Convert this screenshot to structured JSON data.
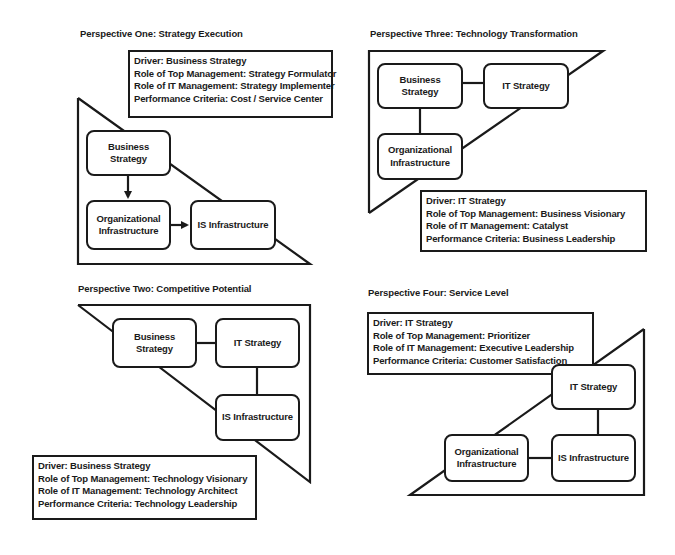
{
  "perspectives": [
    {
      "id": "one",
      "title": "Perspective One: Strategy Execution",
      "info": {
        "driver": "Driver: Business Strategy",
        "top_mgmt": "Role of Top Management: Strategy Formulator",
        "it_mgmt": "Role of IT Management: Strategy Implementer",
        "criteria": "Performance Criteria: Cost / Service Center"
      },
      "nodes": {
        "business_strategy": [
          "Business",
          "Strategy"
        ],
        "org_infra": [
          "Organizational",
          "Infrastructure"
        ],
        "is_infra": [
          "IS Infrastructure"
        ]
      }
    },
    {
      "id": "three",
      "title": "Perspective Three: Technology Transformation",
      "info": {
        "driver": "Driver: IT Strategy",
        "top_mgmt": "Role of Top Management: Business Visionary",
        "it_mgmt": "Role of IT Management: Catalyst",
        "criteria": "Performance Criteria: Business Leadership"
      },
      "nodes": {
        "business_strategy": [
          "Business",
          "Strategy"
        ],
        "it_strategy": [
          "IT Strategy"
        ],
        "org_infra": [
          "Organizational",
          "Infrastructure"
        ]
      }
    },
    {
      "id": "two",
      "title": "Perspective Two: Competitive Potential",
      "info": {
        "driver": "Driver: Business Strategy",
        "top_mgmt": "Role of Top Management: Technology Visionary",
        "it_mgmt": "Role of IT Management: Technology Architect",
        "criteria": "Performance Criteria: Technology Leadership"
      },
      "nodes": {
        "business_strategy": [
          "Business",
          "Strategy"
        ],
        "it_strategy": [
          "IT Strategy"
        ],
        "is_infra": [
          "IS Infrastructure"
        ]
      }
    },
    {
      "id": "four",
      "title": "Perspective Four: Service Level",
      "info": {
        "driver": "Driver: IT Strategy",
        "top_mgmt": "Role of Top Management: Prioritizer",
        "it_mgmt": "Role of IT Management: Executive Leadership",
        "criteria": "Performance Criteria: Customer Satisfaction"
      },
      "nodes": {
        "it_strategy": [
          "IT Strategy"
        ],
        "org_infra": [
          "Organizational",
          "Infrastructure"
        ],
        "is_infra": [
          "IS Infrastructure"
        ]
      }
    }
  ],
  "colors": {
    "stroke": "#1a1a1a",
    "background": "#ffffff"
  }
}
